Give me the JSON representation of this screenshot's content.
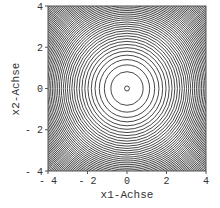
{
  "chart_data": {
    "type": "contour",
    "function": "x1^2 + x2^2",
    "title": "",
    "xlabel": "x1-Achse",
    "ylabel": "x2-Achse",
    "xlim": [
      -4,
      4
    ],
    "ylim": [
      -4,
      4
    ],
    "xticks": [
      "-4",
      "-2",
      "0",
      "2",
      "4"
    ],
    "yticks": [
      "-4",
      "-2",
      "0",
      "2",
      "4"
    ],
    "center": [
      0,
      0
    ],
    "levels": {
      "start": 0.015,
      "step": 0.65,
      "count": 50
    },
    "grid": false,
    "legend": null,
    "line_color": "#333333"
  }
}
